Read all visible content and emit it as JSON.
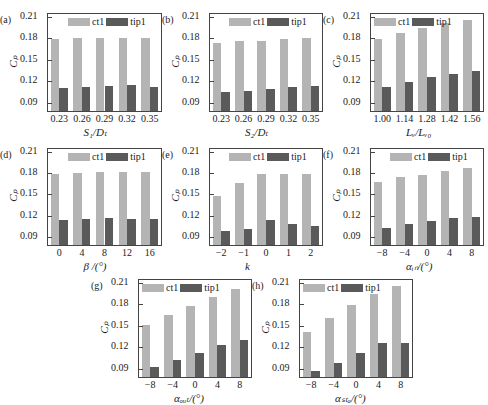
{
  "legend": {
    "series1": "ct1",
    "series2": "tip1"
  },
  "colors": {
    "ct1": "#b4b4b4",
    "tip1": "#5a5a5a"
  },
  "chart_data": [
    {
      "panel": "(a)",
      "type": "bar",
      "xlabel": "S1/Dt",
      "ylabel": "Cp",
      "ylim": [
        0.08,
        0.215
      ],
      "yticks": [
        "0.09",
        "0.12",
        "0.15",
        "0.18",
        "0.21"
      ],
      "categories": [
        "0.23",
        "0.26",
        "0.29",
        "0.32",
        "0.35"
      ],
      "series": [
        {
          "name": "ct1",
          "values": [
            0.18,
            0.181,
            0.182,
            0.181,
            0.181
          ]
        },
        {
          "name": "tip1",
          "values": [
            0.112,
            0.114,
            0.115,
            0.116,
            0.114
          ]
        }
      ]
    },
    {
      "panel": "(b)",
      "type": "bar",
      "xlabel": "S2/Dt",
      "ylabel": "Cp",
      "ylim": [
        0.08,
        0.215
      ],
      "yticks": [
        "0.09",
        "0.12",
        "0.15",
        "0.18",
        "0.21"
      ],
      "categories": [
        "0.23",
        "0.26",
        "0.29",
        "0.32",
        "0.35"
      ],
      "series": [
        {
          "name": "ct1",
          "values": [
            0.175,
            0.177,
            0.178,
            0.18,
            0.181
          ]
        },
        {
          "name": "tip1",
          "values": [
            0.106,
            0.108,
            0.111,
            0.113,
            0.115
          ]
        }
      ]
    },
    {
      "panel": "(c)",
      "type": "bar",
      "xlabel": "Lv/Lv0",
      "ylabel": "Cp",
      "ylim": [
        0.08,
        0.215
      ],
      "yticks": [
        "0.09",
        "0.12",
        "0.15",
        "0.18",
        "0.21"
      ],
      "categories": [
        "1.00",
        "1.14",
        "1.28",
        "1.42",
        "1.56"
      ],
      "series": [
        {
          "name": "ct1",
          "values": [
            0.18,
            0.188,
            0.196,
            0.202,
            0.207
          ]
        },
        {
          "name": "tip1",
          "values": [
            0.114,
            0.121,
            0.127,
            0.132,
            0.136
          ]
        }
      ]
    },
    {
      "panel": "(d)",
      "type": "bar",
      "xlabel": "β/(°)",
      "ylabel": "Cp",
      "ylim": [
        0.08,
        0.215
      ],
      "yticks": [
        "0.09",
        "0.12",
        "0.15",
        "0.18",
        "0.21"
      ],
      "categories": [
        "0",
        "4",
        "8",
        "12",
        "16"
      ],
      "series": [
        {
          "name": "ct1",
          "values": [
            0.18,
            0.181,
            0.182,
            0.182,
            0.183
          ]
        },
        {
          "name": "tip1",
          "values": [
            0.115,
            0.116,
            0.118,
            0.116,
            0.116
          ]
        }
      ]
    },
    {
      "panel": "(e)",
      "type": "bar",
      "xlabel": "k",
      "ylabel": "Cp",
      "ylim": [
        0.08,
        0.215
      ],
      "yticks": [
        "0.09",
        "0.12",
        "0.15",
        "0.18",
        "0.21"
      ],
      "categories": [
        "−2",
        "−1",
        "0",
        "1",
        "2"
      ],
      "series": [
        {
          "name": "ct1",
          "values": [
            0.149,
            0.167,
            0.18,
            0.18,
            0.18
          ]
        },
        {
          "name": "tip1",
          "values": [
            0.1,
            0.103,
            0.115,
            0.109,
            0.107
          ]
        }
      ]
    },
    {
      "panel": "(f)",
      "type": "bar",
      "xlabel": "αin/(°)",
      "ylabel": "Cp",
      "ylim": [
        0.08,
        0.215
      ],
      "yticks": [
        "0.09",
        "0.12",
        "0.15",
        "0.18",
        "0.21"
      ],
      "categories": [
        "−8",
        "−4",
        "0",
        "4",
        "8"
      ],
      "series": [
        {
          "name": "ct1",
          "values": [
            0.169,
            0.175,
            0.179,
            0.184,
            0.188
          ]
        },
        {
          "name": "tip1",
          "values": [
            0.104,
            0.11,
            0.114,
            0.118,
            0.12
          ]
        }
      ]
    },
    {
      "panel": "(g)",
      "type": "bar",
      "xlabel": "αout/(°)",
      "ylabel": "Cp",
      "ylim": [
        0.08,
        0.215
      ],
      "yticks": [
        "0.09",
        "0.12",
        "0.15",
        "0.18",
        "0.21"
      ],
      "categories": [
        "−8",
        "−4",
        "0",
        "4",
        "8"
      ],
      "series": [
        {
          "name": "ct1",
          "values": [
            0.153,
            0.167,
            0.179,
            0.192,
            0.202
          ]
        },
        {
          "name": "tip1",
          "values": [
            0.094,
            0.104,
            0.114,
            0.125,
            0.132
          ]
        }
      ]
    },
    {
      "panel": "(h)",
      "type": "bar",
      "xlabel": "αsta/(°)",
      "ylabel": "Cp",
      "ylim": [
        0.08,
        0.215
      ],
      "yticks": [
        "0.09",
        "0.12",
        "0.15",
        "0.18",
        "0.21"
      ],
      "categories": [
        "−8",
        "−4",
        "0",
        "4",
        "8"
      ],
      "series": [
        {
          "name": "ct1",
          "values": [
            0.142,
            0.162,
            0.18,
            0.196,
            0.207
          ]
        },
        {
          "name": "tip1",
          "values": [
            0.089,
            0.099,
            0.114,
            0.128,
            0.128
          ]
        }
      ]
    }
  ],
  "labels": {
    "xlabels": [
      "S₁/Dₜ",
      "S₂/Dₜ",
      "Lᵥ/Lᵥ₀",
      "β /(°)",
      "k",
      "αᵢₙ/(°)",
      "αₒᵤₜ/(°)",
      "αₛₜₐ/(°)"
    ],
    "ylabel": "Cₚ"
  }
}
